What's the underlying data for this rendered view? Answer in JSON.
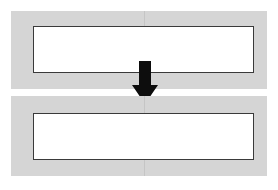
{
  "diagram": {
    "background_color": "#ffffff",
    "steps": [
      {
        "id": "step-before",
        "label": "",
        "band_color": "#d5d5d5",
        "inner_fill": "#ffffff",
        "inner_border_color": "#3a3a3a",
        "seam_color": "#c2c2c2"
      },
      {
        "id": "step-after",
        "label": "",
        "band_color": "#d5d5d5",
        "inner_fill": "#ffffff",
        "inner_border_color": "#3a3a3a",
        "seam_color": "#c2c2c2"
      }
    ],
    "connector": {
      "icon": "arrow-down-icon",
      "label": "",
      "color": "#0d0d0d",
      "direction": "down"
    }
  }
}
